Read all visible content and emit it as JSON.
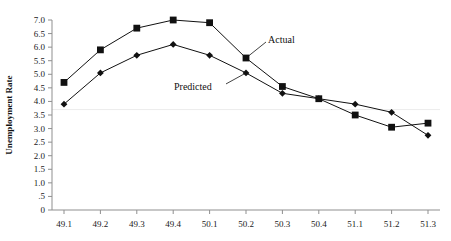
{
  "chart_data": {
    "type": "line",
    "title": "",
    "xlabel": "",
    "ylabel": "Unemployment Rate",
    "categories": [
      "49.1",
      "49.2",
      "49.3",
      "49.4",
      "50.1",
      "50.2",
      "50.3",
      "50.4",
      "51.1",
      "51.2",
      "51.3"
    ],
    "series": [
      {
        "name": "Actual",
        "marker": "square",
        "values": [
          4.7,
          5.9,
          6.7,
          7.0,
          6.9,
          5.6,
          4.55,
          4.1,
          3.5,
          3.05,
          3.2
        ]
      },
      {
        "name": "Predicted",
        "marker": "diamond",
        "values": [
          3.9,
          5.05,
          5.7,
          6.1,
          5.7,
          5.05,
          4.3,
          4.1,
          3.9,
          3.6,
          2.75
        ]
      }
    ],
    "ylim": [
      0,
      7.0
    ],
    "y_ticks": [
      "0",
      ".5",
      "1.0",
      "1.5",
      "2.0",
      "2.5",
      "3.0",
      "3.5",
      "4.0",
      "4.5",
      "5.0",
      "5.5",
      "6.0",
      "6.5",
      "7.0"
    ],
    "y_tick_values": [
      0,
      0.5,
      1.0,
      1.5,
      2.0,
      2.5,
      3.0,
      3.5,
      4.0,
      4.5,
      5.0,
      5.5,
      6.0,
      6.5,
      7.0
    ],
    "grid": false,
    "gridline_at": 3.7,
    "legend_position": "inline-annotations",
    "annotations": [
      {
        "text": "Actual",
        "points_to_category": "50.2",
        "points_to_series": "Actual"
      },
      {
        "text": "Predicted",
        "points_to_category": "50.2",
        "points_to_series": "Predicted"
      }
    ]
  }
}
